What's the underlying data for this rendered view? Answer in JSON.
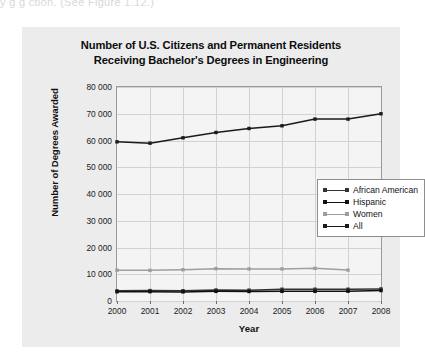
{
  "page": {
    "top_fragment": "y                      g            g            ction. (See Figure 1.12.)"
  },
  "chart_data": {
    "type": "line",
    "title": "Number of U.S. Citizens and Permanent Residents Receiving Bachelor's Degrees in Engineering",
    "title_line1": "Number of U.S. Citizens and Permanent Residents",
    "title_line2": "Receiving Bachelor's Degrees in Engineering",
    "xlabel": "Year",
    "ylabel": "Number of Degrees Awarded",
    "categories": [
      "2000",
      "2001",
      "2002",
      "2003",
      "2004",
      "2005",
      "2006",
      "2007",
      "2008"
    ],
    "x": [
      2000,
      2001,
      2002,
      2003,
      2004,
      2005,
      2006,
      2007,
      2008
    ],
    "ylim": [
      0,
      80000
    ],
    "ytick_labels": [
      "0",
      "10 000",
      "20 000",
      "30 000",
      "40 000",
      "50 000",
      "60 000",
      "70 000",
      "80 000"
    ],
    "ytick_values": [
      0,
      10000,
      20000,
      30000,
      40000,
      50000,
      60000,
      70000,
      80000
    ],
    "grid": true,
    "legend_position": "center-right",
    "series": [
      {
        "name": "African American",
        "color": "#333333",
        "values": [
          3800,
          3900,
          3850,
          4100,
          4050,
          4400,
          4400,
          4400,
          4500
        ]
      },
      {
        "name": "Hispanic",
        "color": "#111111",
        "values": [
          3450,
          3500,
          3400,
          3600,
          3550,
          3600,
          3600,
          3650,
          3900
        ]
      },
      {
        "name": "Women",
        "color": "#9e9e9e",
        "values": [
          11500,
          11450,
          11700,
          12100,
          12000,
          12000,
          12200,
          11550,
          null
        ]
      },
      {
        "name": "All",
        "color": "#1a1a1a",
        "values": [
          59500,
          59000,
          61000,
          63000,
          64500,
          65500,
          68000,
          68000,
          70000
        ]
      }
    ]
  }
}
